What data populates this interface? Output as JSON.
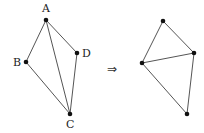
{
  "diagram": {
    "left_graph": {
      "nodes": [
        {
          "id": "A",
          "label": "A",
          "x": 46,
          "y": 20,
          "lx": 42,
          "ly": 12
        },
        {
          "id": "B",
          "label": "B",
          "x": 26,
          "y": 62,
          "lx": 13,
          "ly": 66
        },
        {
          "id": "D",
          "label": "D",
          "x": 77,
          "y": 53,
          "lx": 82,
          "ly": 57
        },
        {
          "id": "C",
          "label": "C",
          "x": 70,
          "y": 114,
          "lx": 66,
          "ly": 128
        }
      ],
      "edges": [
        [
          "A",
          "B"
        ],
        [
          "A",
          "C"
        ],
        [
          "A",
          "D"
        ],
        [
          "B",
          "C"
        ],
        [
          "D",
          "C"
        ]
      ]
    },
    "arrow": {
      "symbol": "⇒",
      "x": 107,
      "y": 73
    },
    "right_graph": {
      "nodes": [
        {
          "id": "T",
          "x": 163,
          "y": 21
        },
        {
          "id": "L",
          "x": 142,
          "y": 63
        },
        {
          "id": "R",
          "x": 194,
          "y": 53
        },
        {
          "id": "Bt",
          "x": 187,
          "y": 114
        }
      ],
      "edges": [
        [
          "T",
          "L"
        ],
        [
          "T",
          "R"
        ],
        [
          "L",
          "R"
        ],
        [
          "L",
          "Bt"
        ],
        [
          "R",
          "Bt"
        ]
      ]
    }
  }
}
